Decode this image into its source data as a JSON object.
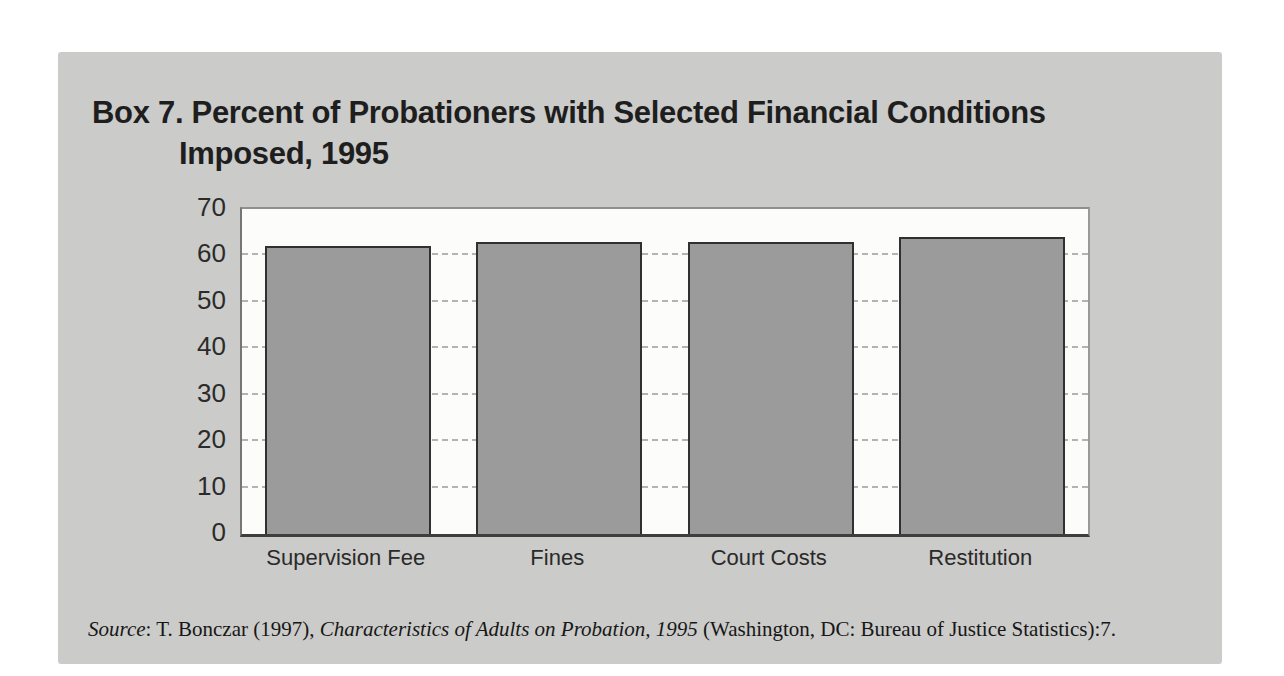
{
  "figure": {
    "title_line1": "Box 7. Percent of Probationers with Selected Financial Conditions",
    "title_line2": "Imposed, 1995",
    "source": {
      "label_italic": "Source",
      "middle": ": T. Bonczar (1997), ",
      "work_italic": "Characteristics of Adults on Probation, 1995",
      "suffix": " (Washington, DC: Bureau of Justice Statistics):7."
    }
  },
  "chart_data": {
    "type": "bar",
    "title": "Box 7. Percent of Probationers with Selected Financial Conditions Imposed, 1995",
    "categories": [
      "Supervision Fee",
      "Fines",
      "Court Costs",
      "Restitution"
    ],
    "values": [
      62,
      63,
      63,
      64
    ],
    "xlabel": "",
    "ylabel": "",
    "ylim": [
      0,
      70
    ],
    "yticks": [
      0,
      10,
      20,
      30,
      40,
      50,
      60,
      70
    ],
    "grid": "horizontal-dashed",
    "legend": "none",
    "bar_fill_color": "#9b9b9b",
    "bar_border_color": "#303030",
    "plot_background": "#fcfcfa",
    "panel_background": "#cbcbc9",
    "gridline_color": "#b3b3b2"
  }
}
